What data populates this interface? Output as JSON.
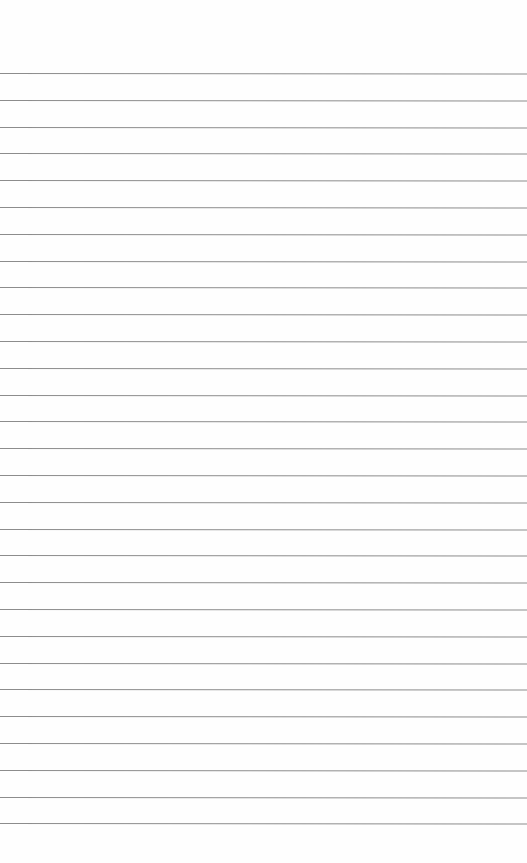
{
  "page": {
    "type": "lined-notepad-sheet",
    "background_color": "#fefefe",
    "rule_color": "#8c8c8c",
    "rule_count": 29,
    "first_rule_y": 73,
    "rule_spacing_px": 26.8
  }
}
